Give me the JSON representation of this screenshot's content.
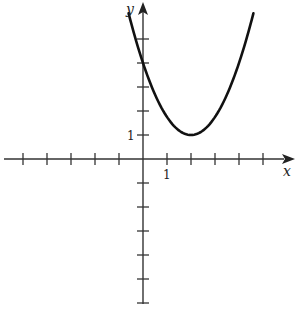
{
  "chart_data": {
    "type": "line",
    "title": "",
    "xlabel": "x",
    "ylabel": "y",
    "tick_labels": {
      "x": [
        "1"
      ],
      "y": [
        "1"
      ]
    },
    "xlim": [
      -5.8,
      5.9
    ],
    "ylim": [
      -6.2,
      6.6
    ],
    "grid": false,
    "legend": null,
    "series": [
      {
        "name": "parabola",
        "equation": "y ≈ 0.75(x − 2)^2 + 1",
        "vertex": [
          2,
          1
        ],
        "y_intercept": 4,
        "x": [
          -0.6,
          -0.5,
          0,
          0.5,
          1,
          1.5,
          2,
          2.5,
          3,
          3.5,
          4,
          4.6
        ],
        "y": [
          6.07,
          5.69,
          4.0,
          2.69,
          1.75,
          1.19,
          1.0,
          1.19,
          1.75,
          2.69,
          4.0,
          6.07
        ]
      }
    ],
    "ticks": {
      "x": [
        -5,
        -4,
        -3,
        -2,
        -1,
        1,
        2,
        3,
        4,
        5
      ],
      "y": [
        -6,
        -5,
        -4,
        -3,
        -2,
        -1,
        1,
        2,
        3,
        4,
        5
      ]
    }
  },
  "axes": {
    "x_label": "x",
    "y_label": "y",
    "x_unit_label": "1",
    "y_unit_label": "1"
  },
  "colors": {
    "ink": "#1a1a1a",
    "background": "#ffffff"
  }
}
